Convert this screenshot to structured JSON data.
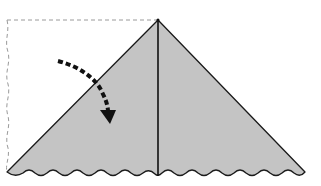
{
  "diagram": {
    "type": "folding-instruction",
    "colors": {
      "paper_fill": "#c4c4c4",
      "outline": "#1a1a1a",
      "dashed_outline": "#9a9a9a",
      "arrow": "#111111",
      "background": "#ffffff"
    },
    "shapes": {
      "folded_triangle": {
        "apex": [
          158,
          20
        ],
        "base_left": [
          7,
          172
        ],
        "base_right": [
          305,
          172
        ]
      },
      "center_crease": {
        "from": [
          158,
          20
        ],
        "to": [
          158,
          176
        ]
      },
      "previous_position_outline": {
        "style": "dashed",
        "top_left": [
          7,
          20
        ],
        "top_right": [
          158,
          20
        ],
        "bottom_left": [
          7,
          172
        ]
      },
      "fold_arrow": {
        "style": "dashed-curve",
        "from": [
          58,
          62
        ],
        "to": [
          110,
          122
        ],
        "direction": "down-right"
      },
      "bottom_edge": {
        "style": "scalloped"
      }
    }
  }
}
